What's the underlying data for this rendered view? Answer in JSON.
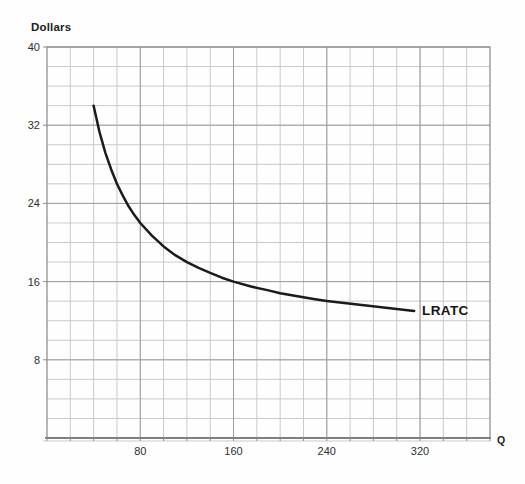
{
  "chart_data": {
    "type": "line",
    "title": "",
    "ylabel": "Dollars",
    "xlabel": "Q",
    "curve_label": "LRATC",
    "xlim": [
      0,
      380
    ],
    "ylim": [
      0,
      40
    ],
    "x_minor_step": 20,
    "y_minor_step": 2,
    "x_tick_values": [
      80,
      160,
      240,
      320
    ],
    "x_tick_labels": [
      "80",
      "160",
      "240",
      "320"
    ],
    "y_tick_values": [
      40,
      32,
      24,
      16,
      8
    ],
    "y_tick_labels": [
      "40",
      "32",
      "24",
      "16",
      "8"
    ],
    "grid": true,
    "legend_position": "none",
    "colors": {
      "curve": "#1b1b1b",
      "grid_minor": "#c9c9c9",
      "grid_major": "#9e9e9e",
      "border": "#8a8a8a",
      "axis_text": "#303030"
    },
    "series": [
      {
        "name": "LRATC",
        "points": [
          [
            40,
            34.0
          ],
          [
            45,
            31.3
          ],
          [
            50,
            29.2
          ],
          [
            55,
            27.5
          ],
          [
            60,
            26.0
          ],
          [
            65,
            24.8
          ],
          [
            70,
            23.7
          ],
          [
            75,
            22.8
          ],
          [
            80,
            22.0
          ],
          [
            90,
            20.7
          ],
          [
            100,
            19.6
          ],
          [
            110,
            18.7
          ],
          [
            120,
            18.0
          ],
          [
            130,
            17.4
          ],
          [
            140,
            16.9
          ],
          [
            150,
            16.4
          ],
          [
            160,
            16.0
          ],
          [
            175,
            15.5
          ],
          [
            190,
            15.1
          ],
          [
            200,
            14.8
          ],
          [
            215,
            14.5
          ],
          [
            230,
            14.2
          ],
          [
            240,
            14.0
          ],
          [
            255,
            13.8
          ],
          [
            270,
            13.6
          ],
          [
            285,
            13.4
          ],
          [
            300,
            13.2
          ],
          [
            315,
            13.0
          ]
        ]
      }
    ]
  }
}
